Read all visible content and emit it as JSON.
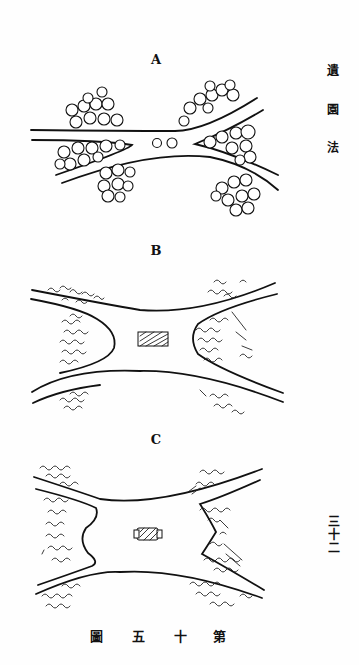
{
  "page": {
    "side_title": [
      "遺",
      "園",
      "法"
    ],
    "page_number_vertical": [
      "三",
      "十",
      "二"
    ],
    "caption": [
      "圖",
      "五",
      "十",
      "第"
    ]
  },
  "figures": [
    {
      "label": "A",
      "description": "road junction with trees clustered in the corners and two round shrubs in the center"
    },
    {
      "label": "B",
      "description": "widened road junction with rectangular hatched monument in the center, tree masses in four corners"
    },
    {
      "label": "C",
      "description": "plaza with concave tree-bordered sides and a small central monument"
    }
  ]
}
